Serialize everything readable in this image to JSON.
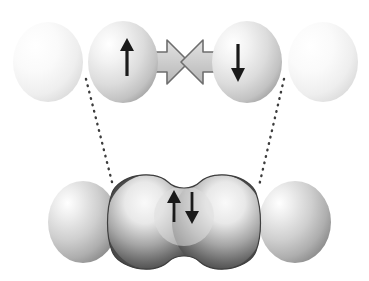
{
  "figure": {
    "kind": "molecular-orbital-diagram",
    "description": "Formation of a covalent sigma bond: two approaching atoms with unpaired antiparallel spins merge into a shared bonding orbital containing one spin-paired electron pair.",
    "background_color": "#ffffff"
  },
  "colors": {
    "outer_sphere_light": "#f2f2f2",
    "outer_sphere_edge": "#d2d2d2",
    "inner_sphere_gray": "#dcdcdc",
    "inner_sphere_edge": "#9e9e9e",
    "bottom_sphere_gray": "#c8c8c8",
    "bottom_sphere_edge": "#8a8a8a",
    "orbital_dark": "#4a4a4a",
    "orbital_highlight": "#f0f0f0",
    "lobe_gray": "#c6c6c6",
    "lobe_outline": "#6e6e6e",
    "arrow_color": "#1a1a1a",
    "dotted_line_color": "#3c3c3c"
  },
  "top_row": {
    "label": "separated-atoms-with-unpaired-electrons",
    "spheres": [
      {
        "id": "outer-left",
        "cx": 48,
        "cy": 62,
        "rx": 35,
        "ry": 40,
        "shade": "light",
        "spin": ""
      },
      {
        "id": "inner-left",
        "cx": 123,
        "cy": 62,
        "rx": 35,
        "ry": 41,
        "shade": "gray",
        "spin": "up"
      },
      {
        "id": "inner-right",
        "cx": 247,
        "cy": 62,
        "rx": 35,
        "ry": 41,
        "shade": "gray",
        "spin": "down"
      },
      {
        "id": "outer-right",
        "cx": 323,
        "cy": 62,
        "rx": 35,
        "ry": 40,
        "shade": "light",
        "spin": ""
      }
    ],
    "spin_up_glyph": "↑",
    "spin_down_glyph": "↓",
    "spin_up_label": "spin-up-electron",
    "spin_down_label": "spin-down-electron",
    "overlap_region_label": "overlapping-atomic-orbitals-bowtie"
  },
  "bottom_row": {
    "label": "bonded-molecule-with-shared-electron-pair",
    "spheres": [
      {
        "id": "bottom-left",
        "cx": 83,
        "cy": 222,
        "rx": 35,
        "ry": 41,
        "shade": "mid"
      },
      {
        "id": "bottom-right",
        "cx": 295,
        "cy": 222,
        "rx": 36,
        "ry": 41,
        "shade": "mid"
      }
    ],
    "orbital": {
      "id": "sigma-bonding-orbital",
      "shape": "peanut",
      "cx": 184,
      "cy": 222,
      "paired_spins_glyph": "↑↓",
      "paired_spins_label": "paired-electrons-spin-up-down"
    }
  },
  "connectors": [
    {
      "id": "left-correlation-line",
      "x1": 86,
      "y1": 79,
      "x2": 113,
      "y2": 186,
      "style": "dotted"
    },
    {
      "id": "right-correlation-line",
      "x1": 284,
      "y1": 79,
      "x2": 259,
      "y2": 186,
      "style": "dotted"
    }
  ]
}
